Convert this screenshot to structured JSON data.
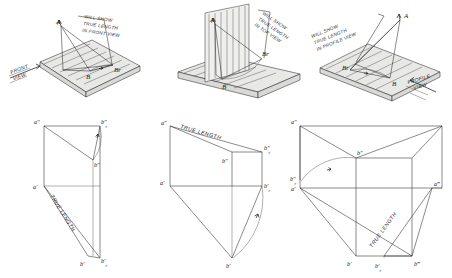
{
  "figure": {
    "ink_color": "#2b2b2b",
    "plane_fill": "#e8e8e6",
    "background": "#ffffff"
  },
  "panels": [
    {
      "id": "top-left",
      "kind": "pictorial",
      "caption": "WILL SHOW\nTRUE LENGTH\nIN FRONT VIEW",
      "caption_lines": [
        "WILL SHOW",
        "TRUE LENGTH",
        "IN FRONT VIEW"
      ],
      "view_label": "FRONT\nVIEW",
      "view_label_lines": [
        "FRONT",
        "VIEW"
      ],
      "points": [
        "A",
        "B",
        "Br"
      ],
      "point_labels": {
        "a": "A",
        "b": "B",
        "br": "Br"
      }
    },
    {
      "id": "top-middle",
      "kind": "pictorial",
      "caption": "WILL SHOW\nTRUE LENGTH\nIN TOP VIEW",
      "caption_lines": [
        "WILL SHOW",
        "TRUE LENGTH",
        "IN TOP VIEW"
      ],
      "view_label": "",
      "view_label_lines": [],
      "points": [
        "A",
        "B",
        "Br"
      ],
      "point_labels": {
        "a": "A",
        "b": "B",
        "br": "Br"
      }
    },
    {
      "id": "top-right",
      "kind": "pictorial",
      "caption": "WILL SHOW\nTRUE LENGTH\nIN PROFILE VIEW",
      "caption_lines": [
        "WILL SHOW",
        "TRUE LENGTH",
        "IN PROFILE VIEW"
      ],
      "view_label": "PROFILE\nVIEW",
      "view_label_lines": [
        "PROFILE",
        "VIEW"
      ],
      "points": [
        "A",
        "B",
        "Br"
      ],
      "point_labels": {
        "a": "A",
        "b": "B",
        "br": "Br"
      }
    },
    {
      "id": "bottom-left",
      "kind": "orthographic",
      "true_length_label": "TRUE LENGTH",
      "labels": {
        "a2": "a″",
        "b2": "b″",
        "b2r": "b″",
        "b2r_sub": "r",
        "a1": "a′",
        "b1": "b′",
        "b1r": "b′",
        "b1r_sub": "r"
      }
    },
    {
      "id": "bottom-middle",
      "kind": "orthographic",
      "true_length_label": "TRUE LENGTH",
      "labels": {
        "a2": "a″",
        "b2": "b″",
        "b2r": "b″",
        "b2r_sub": "r",
        "a1": "a′",
        "b1": "b′",
        "b1r": "b′",
        "b1r_sub": "r"
      }
    },
    {
      "id": "bottom-right",
      "kind": "orthographic",
      "true_length_label": "TRUE LENGTH",
      "labels": {
        "a2": "a″",
        "b2": "b″",
        "b2r": "b″",
        "b2r_sub": "r",
        "a1": "a′",
        "b1": "b′",
        "b1r": "b′",
        "b1r_sub": "r",
        "a3": "a‴",
        "b3": "b‴"
      }
    }
  ],
  "subscript": {
    "r": "r"
  },
  "primes": {
    "single": "′",
    "double": "″",
    "triple": "‴"
  }
}
